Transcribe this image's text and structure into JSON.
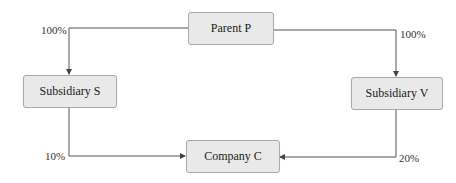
{
  "diagram": {
    "type": "ownership-structure",
    "nodes": [
      {
        "id": "P",
        "label": "Parent P"
      },
      {
        "id": "S",
        "label": "Subsidiary S"
      },
      {
        "id": "V",
        "label": "Subsidiary V"
      },
      {
        "id": "C",
        "label": "Company C"
      }
    ],
    "edges": [
      {
        "from": "P",
        "to": "S",
        "label": "100%"
      },
      {
        "from": "P",
        "to": "V",
        "label": "100%"
      },
      {
        "from": "S",
        "to": "C",
        "label": "10%"
      },
      {
        "from": "V",
        "to": "C",
        "label": "20%"
      }
    ]
  },
  "colors": {
    "node_fill": "#e9e9e9",
    "node_border": "#a9a9a9",
    "line": "#555555"
  }
}
